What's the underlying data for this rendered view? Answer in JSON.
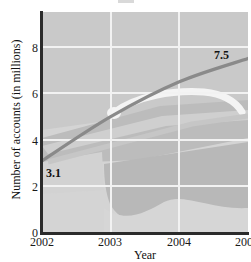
{
  "chart_data": {
    "type": "line",
    "title": "",
    "xlabel": "Year",
    "ylabel": "Number of accounts (in millions)",
    "x": [
      2002,
      2003,
      2004,
      2005
    ],
    "values": [
      3.1,
      5.0,
      6.5,
      7.5
    ],
    "series": [
      {
        "name": "Number of accounts",
        "values": [
          3.1,
          5.0,
          6.5,
          7.5
        ]
      }
    ],
    "xlim": [
      2002,
      2005
    ],
    "ylim": [
      0,
      9.5
    ],
    "x_ticks": [
      "2002",
      "2003",
      "2004",
      "2005"
    ],
    "y_ticks": [
      "0",
      "2",
      "4",
      "6",
      "8"
    ],
    "y_tick_values": [
      0,
      2,
      4,
      6,
      8
    ],
    "grid": true,
    "legend": "none",
    "line_color": "#8a8a8a",
    "plot_background": "#c9c9c9",
    "gridline_color": "#f2f2f2",
    "axis_color": "#2b2b2b",
    "annotations": [
      {
        "label": "3.1",
        "x": 2002,
        "y": 3.1
      },
      {
        "label": "7.5",
        "x": 2005,
        "y": 7.5
      }
    ]
  },
  "axes": {
    "x_title": "Year",
    "y_title": "Number of accounts (in millions)",
    "x_tick_labels": [
      "2002",
      "2003",
      "2004",
      "2005"
    ],
    "y_tick_labels": [
      "8",
      "6",
      "4",
      "2",
      "0"
    ]
  },
  "annotations": {
    "start_value": "3.1",
    "end_value": "7.5"
  }
}
